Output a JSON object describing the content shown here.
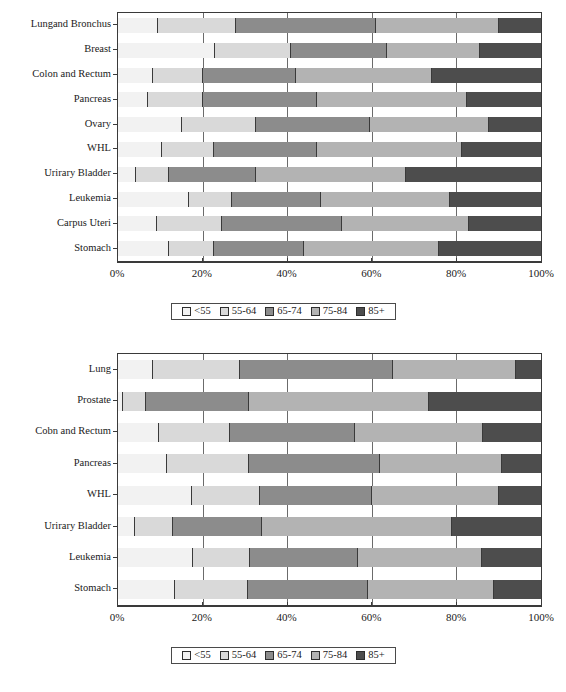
{
  "page": {
    "background": "#ffffff",
    "width": 566,
    "height": 692
  },
  "legend_labels": [
    "<55",
    "55-64",
    "65-74",
    "75-84",
    "85+"
  ],
  "series_colors": [
    "#f2f2f2",
    "#d9d9d9",
    "#8c8c8c",
    "#b3b3b3",
    "#4d4d4d"
  ],
  "axis": {
    "ticks": [
      "0%",
      "20%",
      "40%",
      "60%",
      "80%",
      "100%"
    ],
    "tick_values": [
      0,
      20,
      40,
      60,
      80,
      100
    ]
  },
  "chart_data": [
    {
      "type": "bar",
      "title": "",
      "subtitle": "",
      "orientation": "horizontal",
      "stacked": true,
      "normalized": true,
      "xlabel": "",
      "ylabel": "",
      "xlim": [
        0,
        100
      ],
      "grid": true,
      "legend_position": "bottom",
      "tick_labels": [
        "0%",
        "20%",
        "40%",
        "60%",
        "80%",
        "100%"
      ],
      "categories": [
        "Lungand Bronchus",
        "Breast",
        "Colon and Rectum",
        "Pancreas",
        "Ovary",
        "WHL",
        "Urirary Bladder",
        "Leukemia",
        "Carpus Uteri",
        "Stomach"
      ],
      "series": [
        {
          "name": "<55",
          "values": [
            9.5,
            23.0,
            8.2,
            7.0,
            15.2,
            10.5,
            4.3,
            16.7,
            9.3,
            12.0
          ]
        },
        {
          "name": "55-64",
          "values": [
            18.5,
            18.0,
            11.8,
            13.0,
            17.5,
            12.1,
            7.7,
            10.3,
            15.2,
            10.6
          ]
        },
        {
          "name": "65-74",
          "values": [
            33.0,
            22.5,
            22.2,
            27.0,
            26.9,
            24.4,
            20.7,
            21.0,
            28.5,
            21.4
          ]
        },
        {
          "name": "75-84",
          "values": [
            29.0,
            22.2,
            32.0,
            35.5,
            28.0,
            34.4,
            35.3,
            30.6,
            30.0,
            32.0
          ]
        },
        {
          "name": "85+",
          "values": [
            10.0,
            14.3,
            25.8,
            17.5,
            12.4,
            18.6,
            32.0,
            21.4,
            17.0,
            24.0
          ]
        }
      ]
    },
    {
      "type": "bar",
      "title": "",
      "subtitle": "",
      "orientation": "horizontal",
      "stacked": true,
      "normalized": true,
      "xlabel": "",
      "ylabel": "",
      "xlim": [
        0,
        100
      ],
      "grid": true,
      "legend_position": "bottom",
      "tick_labels": [
        "0%",
        "20%",
        "40%",
        "60%",
        "80%",
        "100%"
      ],
      "categories": [
        "Lung",
        "Prostate",
        "Cobn and Rectum",
        "Pancreas",
        "WHL",
        "Urirary Bladder",
        "Leukemia",
        "Stomach"
      ],
      "series": [
        {
          "name": "<55",
          "values": [
            8.2,
            1.2,
            9.7,
            11.7,
            17.5,
            4.0,
            17.8,
            13.5
          ]
        },
        {
          "name": "55-64",
          "values": [
            20.6,
            5.4,
            16.8,
            19.3,
            16.0,
            9.0,
            13.4,
            17.2
          ]
        },
        {
          "name": "65-74",
          "values": [
            36.2,
            24.4,
            29.5,
            31.0,
            26.5,
            21.0,
            25.6,
            28.3
          ]
        },
        {
          "name": "75-84",
          "values": [
            29.0,
            42.6,
            30.4,
            28.7,
            30.0,
            45.0,
            29.2,
            30.0
          ]
        },
        {
          "name": "85+",
          "values": [
            6.0,
            26.4,
            13.6,
            9.3,
            10.0,
            21.0,
            14.0,
            11.0
          ]
        }
      ]
    }
  ]
}
